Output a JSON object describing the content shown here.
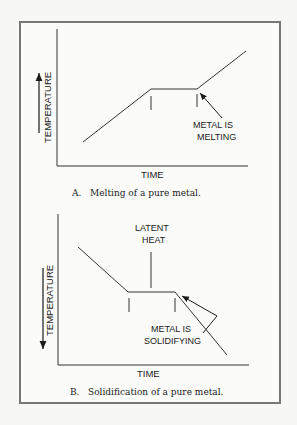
{
  "colors": {
    "frame": "#777777",
    "ink": "#1a1a1a",
    "background": "#fbfbf9"
  },
  "panel_a": {
    "y_label": "TEMPERATURE",
    "y_arrow_direction": "up",
    "x_label": "TIME",
    "annotation_line1": "METAL IS",
    "annotation_line2": "MELTING",
    "caption_letter": "A.",
    "caption_text": "Melting of a pure metal."
  },
  "panel_b": {
    "y_label": "TEMPERATURE",
    "y_arrow_direction": "down",
    "x_label": "TIME",
    "latent_line1": "LATENT",
    "latent_line2": "HEAT",
    "annotation_line1": "METAL IS",
    "annotation_line2": "SOLIDIFYING",
    "caption_letter": "B.",
    "caption_text": "Solidification of a pure metal."
  }
}
